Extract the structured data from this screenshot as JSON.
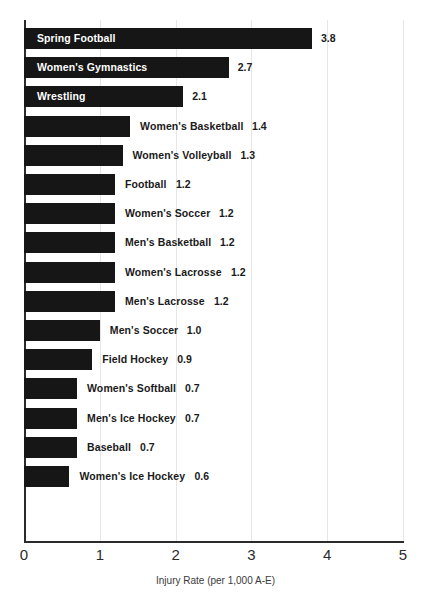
{
  "chart_data": {
    "type": "bar",
    "orientation": "horizontal",
    "title": "",
    "xlabel": "Injury Rate (per 1,000 A-E)",
    "ylabel": "",
    "xlim": [
      0,
      5
    ],
    "xticks": [
      "0",
      "1",
      "2",
      "3",
      "4",
      "5"
    ],
    "grid": true,
    "legend": null,
    "categories": [
      "Spring Football",
      "Women's Gymnastics",
      "Wrestling",
      "Women's Basketball",
      "Women's Volleyball",
      "Football",
      "Women's Soccer",
      "Men's Basketball",
      "Women's Lacrosse",
      "Men's Lacrosse",
      "Men's Soccer",
      "Field Hockey",
      "Women's Softball",
      "Men's Ice Hockey",
      "Baseball",
      "Women's Ice Hockey"
    ],
    "values": [
      3.8,
      2.7,
      2.1,
      1.4,
      1.3,
      1.2,
      1.2,
      1.2,
      1.2,
      1.2,
      1.0,
      0.9,
      0.7,
      0.7,
      0.7,
      0.6
    ],
    "value_labels": [
      "3.8",
      "2.7",
      "2.1",
      "1.4",
      "1.3",
      "1.2",
      "1.2",
      "1.2",
      "1.2",
      "1.2",
      "1.0",
      "0.9",
      "0.7",
      "0.7",
      "0.7",
      "0.6"
    ],
    "bar_color": "#161616",
    "grid_color": "#e6e6e6",
    "axis_color": "#2b2b2b",
    "inside_label_color": "#ffffff",
    "outside_label_color": "#1a1a1a",
    "label_placement": [
      "inside",
      "inside",
      "inside",
      "outside",
      "outside",
      "outside",
      "outside",
      "outside",
      "outside",
      "outside",
      "outside",
      "outside",
      "outside",
      "outside",
      "outside",
      "outside"
    ]
  },
  "bars": [
    {
      "label": "Spring Football",
      "value_label": "3.8"
    },
    {
      "label": "Women's Gymnastics",
      "value_label": "2.7"
    },
    {
      "label": "Wrestling",
      "value_label": "2.1"
    },
    {
      "label": "Women's Basketball",
      "value_label": "1.4"
    },
    {
      "label": "Women's Volleyball",
      "value_label": "1.3"
    },
    {
      "label": "Football",
      "value_label": "1.2"
    },
    {
      "label": "Women's Soccer",
      "value_label": "1.2"
    },
    {
      "label": "Men's Basketball",
      "value_label": "1.2"
    },
    {
      "label": "Women's Lacrosse",
      "value_label": "1.2"
    },
    {
      "label": "Men's Lacrosse",
      "value_label": "1.2"
    },
    {
      "label": "Men's Soccer",
      "value_label": "1.0"
    },
    {
      "label": "Field Hockey",
      "value_label": "0.9"
    },
    {
      "label": "Women's Softball",
      "value_label": "0.7"
    },
    {
      "label": "Men's Ice Hockey",
      "value_label": "0.7"
    },
    {
      "label": "Baseball",
      "value_label": "0.7"
    },
    {
      "label": "Women's Ice Hockey",
      "value_label": "0.6"
    }
  ],
  "axis": {
    "x_title": "Injury Rate (per 1,000 A-E)",
    "ticks": [
      "0",
      "1",
      "2",
      "3",
      "4",
      "5"
    ]
  }
}
